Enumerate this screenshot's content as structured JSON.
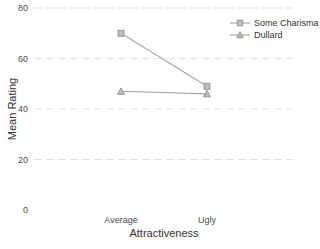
{
  "chart_data": {
    "type": "line",
    "title": "",
    "xlabel": "Attractiveness",
    "ylabel": "Mean Rating",
    "categories": [
      "Average",
      "Ugly"
    ],
    "series": [
      {
        "name": "Some Charisma",
        "marker": "square",
        "values": [
          70,
          49
        ]
      },
      {
        "name": "Dullard",
        "marker": "triangle",
        "values": [
          47,
          46
        ]
      }
    ],
    "ylim": [
      0,
      80
    ],
    "yticks": [
      0,
      20,
      40,
      60,
      80
    ],
    "grid": {
      "horizontal": true,
      "style": "dashed",
      "zero_line": false
    },
    "legend": {
      "position": "top-right"
    },
    "colors": {
      "line": "#a6a6a6",
      "marker_fill": "#bdbdbd",
      "grid": "#e3e3e3"
    }
  }
}
